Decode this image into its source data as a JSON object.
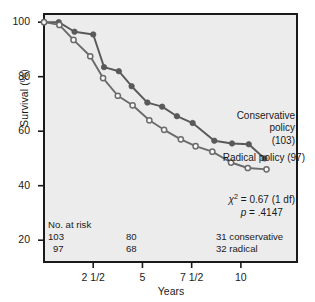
{
  "chart_data": {
    "type": "line",
    "title": "",
    "xlabel": "Years",
    "ylabel": "Survival (%)",
    "xlim": [
      0,
      12.85
    ],
    "ylim": [
      12,
      103
    ],
    "grid": false,
    "legend_position": "inline-right",
    "y_ticks": [
      100,
      80,
      60,
      40,
      20
    ],
    "y_tick_labels": [
      "100",
      "80",
      "60",
      "40",
      "20"
    ],
    "x_ticks": [
      2.5,
      5,
      7.5,
      10
    ],
    "x_tick_labels": [
      "2 1/2",
      "5",
      "7 1/2",
      "10"
    ],
    "series": [
      {
        "name": "Conservative policy",
        "n": 103,
        "marker": "filled-circle",
        "color": "#595959",
        "points": [
          {
            "x": 0.0,
            "y": 100
          },
          {
            "x": 0.75,
            "y": 100
          },
          {
            "x": 1.55,
            "y": 96.5
          },
          {
            "x": 2.5,
            "y": 95.5
          },
          {
            "x": 3.05,
            "y": 83.5
          },
          {
            "x": 3.8,
            "y": 82.0
          },
          {
            "x": 4.45,
            "y": 76.5
          },
          {
            "x": 5.25,
            "y": 70.5
          },
          {
            "x": 6.0,
            "y": 69.0
          },
          {
            "x": 6.75,
            "y": 65.5
          },
          {
            "x": 7.55,
            "y": 63.0
          },
          {
            "x": 8.65,
            "y": 56.5
          },
          {
            "x": 9.55,
            "y": 55.5
          },
          {
            "x": 10.4,
            "y": 55.2
          },
          {
            "x": 11.2,
            "y": 50.0
          }
        ]
      },
      {
        "name": "Radical policy",
        "n": 97,
        "marker": "open-circle",
        "color": "#6b6b6b",
        "points": [
          {
            "x": 0.0,
            "y": 100
          },
          {
            "x": 0.78,
            "y": 99.0
          },
          {
            "x": 1.5,
            "y": 93.5
          },
          {
            "x": 2.35,
            "y": 87.5
          },
          {
            "x": 3.0,
            "y": 79.5
          },
          {
            "x": 3.75,
            "y": 73.0
          },
          {
            "x": 4.5,
            "y": 69.5
          },
          {
            "x": 5.35,
            "y": 64.0
          },
          {
            "x": 6.1,
            "y": 60.5
          },
          {
            "x": 6.95,
            "y": 57.0
          },
          {
            "x": 7.7,
            "y": 54.5
          },
          {
            "x": 8.55,
            "y": 52.5
          },
          {
            "x": 9.5,
            "y": 48.5
          },
          {
            "x": 10.35,
            "y": 46.5
          },
          {
            "x": 11.3,
            "y": 46.0
          }
        ]
      }
    ],
    "annotations": {
      "conservative_label": {
        "line1": "Conservative",
        "line2": "policy",
        "line3": "(103)"
      },
      "radical_label": "Radical policy (97)",
      "statistic_chi": "= 0.67 (1 df)",
      "statistic_chi_symbol": "χ",
      "statistic_chi_exponent": "2",
      "statistic_p": "= .4147",
      "statistic_p_symbol": "p",
      "risk_title": "No. at risk",
      "risk_rows": [
        {
          "col1": "103",
          "col2": "80",
          "col3": "31 conservative"
        },
        {
          "col1": "97",
          "col2": "68",
          "col3": "32 radical"
        }
      ]
    }
  },
  "colors": {
    "plot_background": "#ececec",
    "frame": "#1a1a1a",
    "conservative": "#595959",
    "radical": "#6b6b6b",
    "text": "#1a1a1a"
  }
}
